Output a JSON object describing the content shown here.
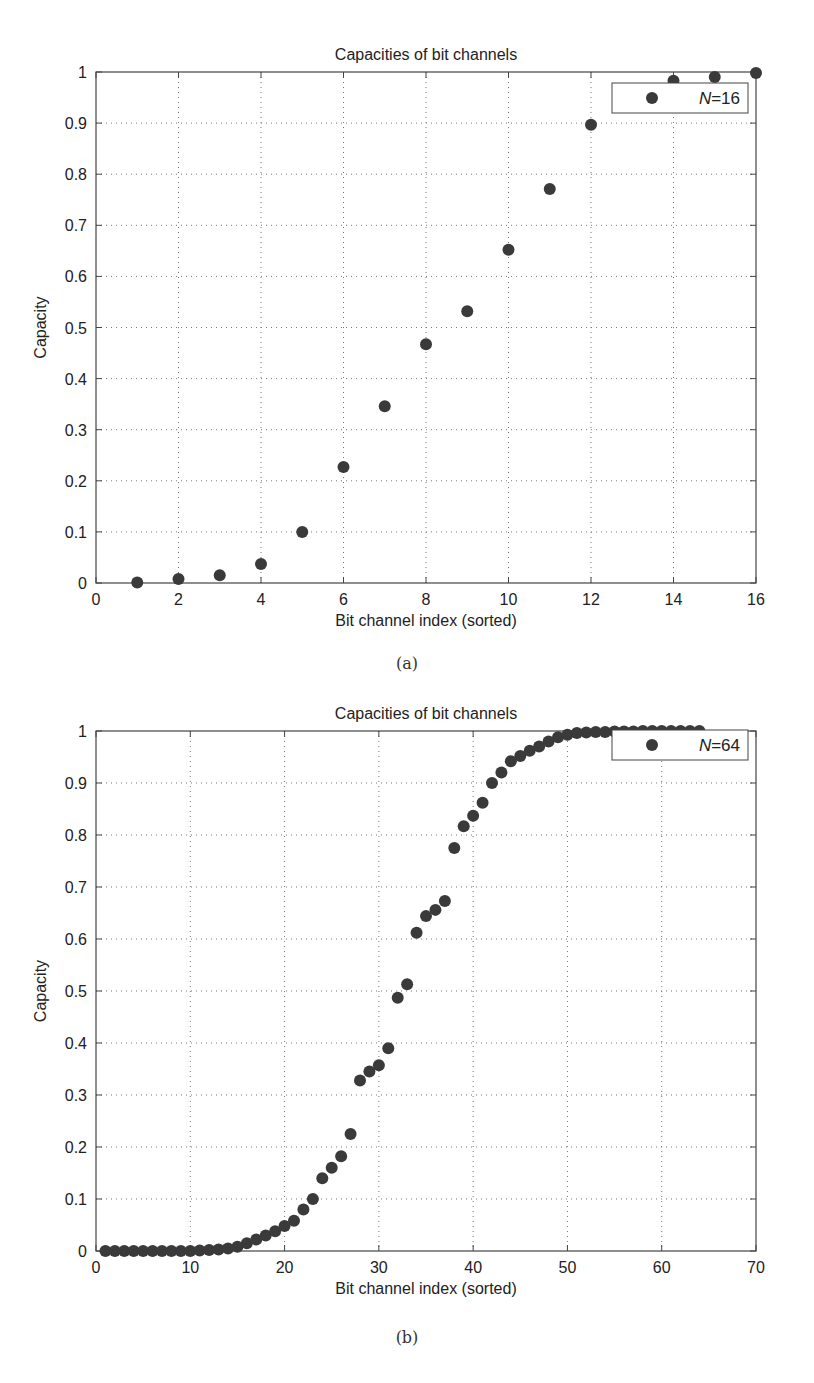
{
  "chart_data": [
    {
      "type": "scatter",
      "title": "Capacities of bit channels",
      "xlabel": "Bit channel index (sorted)",
      "ylabel": "Capacity",
      "xlim": [
        0,
        16
      ],
      "ylim": [
        0,
        1
      ],
      "xticks": [
        0,
        2,
        4,
        6,
        8,
        10,
        12,
        14,
        16
      ],
      "yticks": [
        0,
        0.1,
        0.2,
        0.3,
        0.4,
        0.5,
        0.6,
        0.7,
        0.8,
        0.9,
        1
      ],
      "ytick_labels": [
        "0",
        "0.1",
        "0.2",
        "0.3",
        "0.4",
        "0.5",
        "0.6",
        "0.7",
        "0.8",
        "0.9",
        "1"
      ],
      "grid": true,
      "legend_position": "upper right",
      "caption": "(a)",
      "series": [
        {
          "name": "N=16",
          "legend_label_var": "N",
          "legend_label_val": "=16",
          "x": [
            1,
            2,
            3,
            4,
            5,
            6,
            7,
            8,
            9,
            10,
            11,
            12,
            13,
            14,
            15,
            16
          ],
          "values": [
            0.001,
            0.008,
            0.015,
            0.037,
            0.1,
            0.227,
            0.346,
            0.467,
            0.532,
            0.652,
            0.771,
            0.897,
            0.96,
            0.983,
            0.99,
            0.998
          ]
        }
      ]
    },
    {
      "type": "scatter",
      "title": "Capacities of bit channels",
      "xlabel": "Bit channel index (sorted)",
      "ylabel": "Capacity",
      "xlim": [
        0,
        70
      ],
      "ylim": [
        0,
        1
      ],
      "xticks": [
        0,
        10,
        20,
        30,
        40,
        50,
        60,
        70
      ],
      "yticks": [
        0,
        0.1,
        0.2,
        0.3,
        0.4,
        0.5,
        0.6,
        0.7,
        0.8,
        0.9,
        1
      ],
      "ytick_labels": [
        "0",
        "0.1",
        "0.2",
        "0.3",
        "0.4",
        "0.5",
        "0.6",
        "0.7",
        "0.8",
        "0.9",
        "1"
      ],
      "grid": true,
      "legend_position": "upper right",
      "caption": "(b)",
      "series": [
        {
          "name": "N=64",
          "legend_label_var": "N",
          "legend_label_val": "=64",
          "x": [
            1,
            2,
            3,
            4,
            5,
            6,
            7,
            8,
            9,
            10,
            11,
            12,
            13,
            14,
            15,
            16,
            17,
            18,
            19,
            20,
            21,
            22,
            23,
            24,
            25,
            26,
            27,
            28,
            29,
            30,
            31,
            32,
            33,
            34,
            35,
            36,
            37,
            38,
            39,
            40,
            41,
            42,
            43,
            44,
            45,
            46,
            47,
            48,
            49,
            50,
            51,
            52,
            53,
            54,
            55,
            56,
            57,
            58,
            59,
            60,
            61,
            62,
            63,
            64
          ],
          "values": [
            0,
            0,
            0,
            0,
            0,
            0,
            0,
            0,
            0,
            0,
            0.001,
            0.002,
            0.003,
            0.005,
            0.008,
            0.015,
            0.022,
            0.03,
            0.038,
            0.048,
            0.058,
            0.08,
            0.1,
            0.14,
            0.16,
            0.182,
            0.225,
            0.328,
            0.345,
            0.357,
            0.39,
            0.487,
            0.513,
            0.612,
            0.644,
            0.656,
            0.673,
            0.775,
            0.817,
            0.837,
            0.862,
            0.9,
            0.92,
            0.942,
            0.952,
            0.962,
            0.97,
            0.98,
            0.988,
            0.993,
            0.996,
            0.997,
            0.998,
            0.998,
            0.999,
            0.999,
            0.999,
            1,
            1,
            1,
            1,
            1,
            1,
            1
          ]
        }
      ]
    }
  ],
  "colors": {
    "marker": "#3a3a3a",
    "axis": "#444444",
    "grid": "#777777",
    "text": "#222222"
  }
}
